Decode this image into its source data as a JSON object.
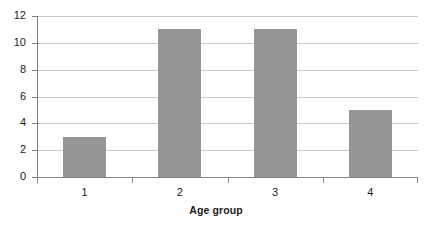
{
  "chart_data": {
    "type": "bar",
    "title": "",
    "subtitle": "",
    "xlabel": "Age group",
    "ylabel": "",
    "categories": [
      "1",
      "2",
      "3",
      "4"
    ],
    "values": [
      3,
      11,
      11,
      5
    ],
    "series": [
      {
        "name": "",
        "values": [
          3,
          11,
          11,
          5
        ]
      }
    ],
    "ylim": [
      0,
      12
    ],
    "y_ticks": [
      0,
      2,
      4,
      6,
      8,
      10,
      12
    ],
    "y_tick_labels": [
      "0",
      "2",
      "4",
      "6",
      "8",
      "10",
      "12"
    ],
    "x_tick_labels": [
      "1",
      "2",
      "3",
      "4"
    ],
    "grid": "horizontal",
    "legend": "none",
    "annotations": [],
    "colors": {
      "bar_fill": "#969696",
      "gridline": "#c8c8c8",
      "axis_line": "#868686",
      "background": "#ffffff",
      "text": "#1a1a1a"
    }
  }
}
